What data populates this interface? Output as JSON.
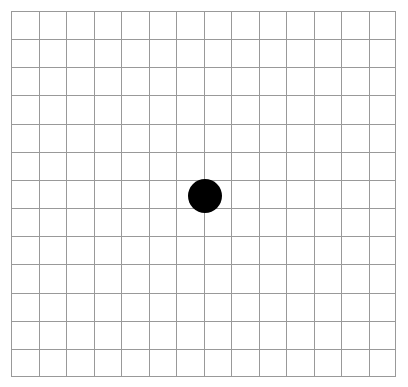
{
  "app": {
    "title": "Amsler Grid",
    "description": "Amsler grid chart: a square grid of evenly spaced lines with a solid central fixation dot."
  },
  "canvas": {
    "width": 408,
    "height": 387,
    "background_color": "#ffffff"
  },
  "grid": {
    "name": "amsler-grid",
    "columns": 14,
    "rows": 13,
    "left": 11,
    "top": 11,
    "width": 385,
    "height": 366,
    "cell_width": 27.5,
    "cell_height": 28.15,
    "line_color": "#999999",
    "line_width": 1,
    "border_color": "#999999",
    "border_width": 1
  },
  "fixation_dot": {
    "name": "fixation-dot",
    "shape": "circle",
    "color": "#000000",
    "center_x": 205,
    "center_y": 196,
    "diameter": 34,
    "radius": 17
  },
  "chart_data": {
    "type": "table",
    "xlabel": "",
    "ylabel": "",
    "categories": [],
    "values": [],
    "grid": true,
    "legend": "none",
    "annotations": [
      "central fixation dot at grid center"
    ]
  }
}
